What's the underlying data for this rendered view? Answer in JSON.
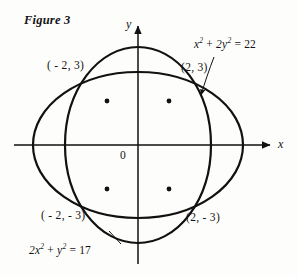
{
  "figure": {
    "caption": "Figure 3",
    "background_color": "#fdfdfb",
    "stroke_color": "#111111"
  },
  "axes": {
    "x_label": "x",
    "y_label": "y",
    "origin_label": "0",
    "origin_px": {
      "x": 138,
      "y": 145
    },
    "x_axis": {
      "x1": 14,
      "x2": 272,
      "y": 145,
      "arrow": "right"
    },
    "y_axis": {
      "y1": 264,
      "y2": 22,
      "x": 138,
      "arrow": "up"
    }
  },
  "point_labels": {
    "top_left": "( - 2, 3)",
    "top_right": "(2, 3)",
    "bottom_left": "( - 2,  - 3)",
    "bottom_right": "(2,  - 3)"
  },
  "equations": {
    "wide_ellipse": {
      "lhs_a": "x",
      "exp_a": "2",
      "plus": "+",
      "lhs_b": "2y",
      "exp_b": "2",
      "eq": "=",
      "rhs": "22"
    },
    "tall_ellipse": {
      "lhs_a": "2x",
      "exp_a": "2",
      "plus": "+",
      "lhs_b": "y",
      "exp_b": "2",
      "eq": "=",
      "rhs": "17"
    }
  },
  "chart_data": {
    "type": "line",
    "title": "Figure 3",
    "xlabel": "x",
    "ylabel": "y",
    "grid": false,
    "legend": "none",
    "xlim": [
      -7,
      7
    ],
    "ylim": [
      -5,
      5
    ],
    "annotations": [
      {
        "text": "x^2 + 2y^2 = 22",
        "target": "wide-ellipse",
        "leader": true
      },
      {
        "text": "2x^2 + y^2 = 17",
        "target": "tall-ellipse",
        "leader": true
      }
    ],
    "series": [
      {
        "name": "x^2 + 2y^2 = 22",
        "kind": "ellipse",
        "semi_axis_x": 4.690415759823429,
        "semi_axis_y": 3.3166247903554,
        "center": [
          0,
          0
        ],
        "pixel_center": [
          138,
          145
        ],
        "pixel_rx": 105,
        "pixel_ry": 73
      },
      {
        "name": "2x^2 + y^2 = 17",
        "kind": "ellipse",
        "semi_axis_x": 2.9154759474226504,
        "semi_axis_y": 4.123105625617661,
        "center": [
          0,
          0
        ],
        "pixel_center": [
          138,
          145
        ],
        "pixel_rx": 73,
        "pixel_ry": 98
      }
    ],
    "intersections": [
      {
        "x": -2,
        "y": 3,
        "label": "( - 2, 3)",
        "pixel": [
          107,
          101
        ]
      },
      {
        "x": 2,
        "y": 3,
        "label": "(2, 3)",
        "pixel": [
          169,
          101
        ]
      },
      {
        "x": -2,
        "y": -3,
        "label": "( - 2,  - 3)",
        "pixel": [
          107,
          189
        ]
      },
      {
        "x": 2,
        "y": -3,
        "label": "(2,  - 3)",
        "pixel": [
          169,
          189
        ]
      }
    ]
  }
}
